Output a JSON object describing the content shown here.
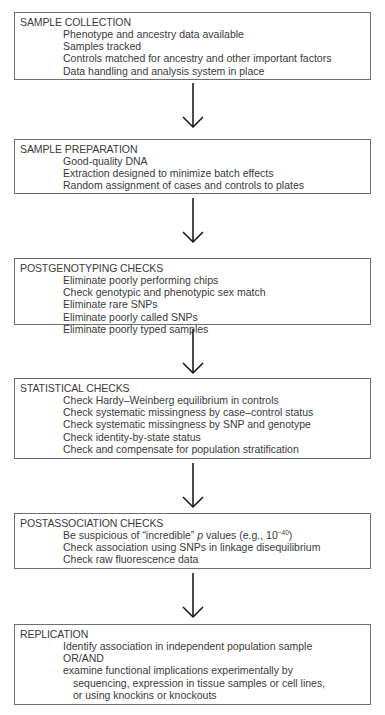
{
  "flowchart": {
    "steps": [
      {
        "title": "SAMPLE COLLECTION",
        "items": [
          "Phenotype and ancestry data available",
          "Samples tracked",
          "Controls matched for ancestry and other important factors",
          "Data handling and analysis system in place"
        ]
      },
      {
        "title": "SAMPLE PREPARATION",
        "items": [
          "Good-quality DNA",
          "Extraction designed to minimize batch effects",
          "Random assignment of cases and controls to plates"
        ]
      },
      {
        "title": "POSTGENOTYPING CHECKS",
        "items": [
          "Eliminate poorly performing chips",
          "Check genotypic and phenotypic sex match",
          "Eliminate rare SNPs",
          "Eliminate poorly called SNPs",
          "Eliminate poorly typed samples"
        ]
      },
      {
        "title": "STATISTICAL CHECKS",
        "items": [
          "Check Hardy–Weinberg equilibrium in controls",
          "Check systematic missingness by case–control status",
          "Check systematic missingness by SNP and genotype",
          "Check identity-by-state status",
          "Check and compensate for population stratification"
        ]
      },
      {
        "title": "POSTASSOCIATION CHECKS",
        "items": [
          {
            "prefix": "Be suspicious of “incredible” ",
            "italic": "p",
            "middle": " values (e.g., 10",
            "sup": "−40",
            "suffix": ")"
          },
          "Check association using SNPs in linkage disequilibrium",
          "Check raw fluorescence data"
        ]
      },
      {
        "title": "REPLICATION",
        "items": [
          "Identify association in independent population sample",
          "OR/AND",
          "examine functional implications experimentally by",
          "sequencing, expression in tissue samples or cell lines,",
          "or using knockins or knockouts"
        ]
      }
    ],
    "arrow_icon": "down-arrow-icon",
    "colors": {
      "border": "#6e6e6e",
      "text": "#3a3a3a",
      "arrow": "#111111",
      "background": "#ffffff"
    }
  }
}
